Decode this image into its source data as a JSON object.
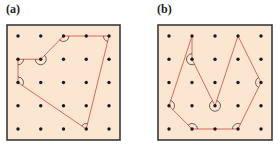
{
  "colors": {
    "background": "#fbe6d2",
    "frame": "#3a3a3a",
    "dot": "#1a1a1a",
    "polygon": "#d9685e",
    "arc": "#2a2a2a"
  },
  "panels": [
    {
      "label": "(a)",
      "grid": {
        "cols": 5,
        "rows": 5
      },
      "polygon": [
        [
          2,
          0
        ],
        [
          4,
          0
        ],
        [
          3,
          4
        ],
        [
          0,
          2
        ],
        [
          0,
          1
        ],
        [
          1,
          1
        ]
      ],
      "angle_marks": [
        [
          2,
          0
        ],
        [
          4,
          0
        ],
        [
          3,
          4
        ],
        [
          0,
          2
        ],
        [
          0,
          1
        ],
        [
          1,
          1
        ]
      ]
    },
    {
      "label": "(b)",
      "grid": {
        "cols": 5,
        "rows": 5
      },
      "polygon": [
        [
          1,
          0
        ],
        [
          1,
          1
        ],
        [
          2,
          3
        ],
        [
          3,
          0
        ],
        [
          4,
          2
        ],
        [
          3,
          4
        ],
        [
          1,
          4
        ],
        [
          0,
          3
        ]
      ],
      "angle_marks": [
        [
          1,
          1
        ],
        [
          2,
          3
        ],
        [
          4,
          2
        ],
        [
          3,
          4
        ],
        [
          1,
          4
        ],
        [
          0,
          3
        ]
      ]
    }
  ]
}
